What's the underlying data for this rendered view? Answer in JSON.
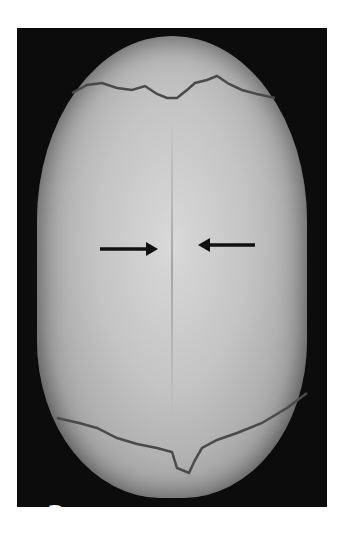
{
  "figure": {
    "panel_label": "a",
    "annotations": [
      {
        "type": "arrow",
        "direction": "right",
        "x1": 100,
        "x2": 158,
        "y": 249
      },
      {
        "type": "arrow",
        "direction": "left",
        "x1": 255,
        "x2": 198,
        "y": 245
      }
    ],
    "colors": {
      "background": "#0c0c0c",
      "page": "#ffffff",
      "arrow": "#111111",
      "label": "#ffffff"
    }
  }
}
